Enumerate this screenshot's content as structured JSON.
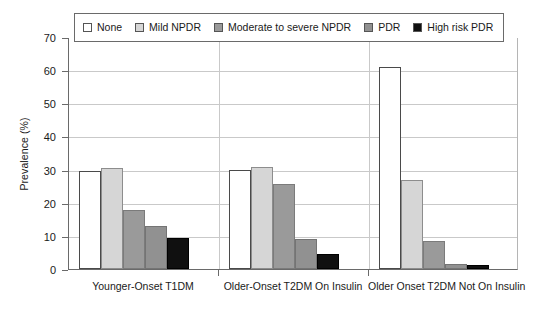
{
  "chart_data": {
    "type": "bar",
    "title": "",
    "subtitle": "",
    "xlabel": "",
    "ylabel": "Prevalence (%)",
    "ylim": [
      0,
      70
    ],
    "yticks": [
      0,
      10,
      20,
      30,
      40,
      50,
      60,
      70
    ],
    "ytick_labels": [
      "0",
      "10",
      "20",
      "30",
      "40",
      "50",
      "60",
      "70"
    ],
    "grid": true,
    "grid_axis": "y",
    "legend_position": "top-inside",
    "categories": [
      "Younger-Onset T1DM",
      "Older-Onset T2DM On Insulin",
      "Older Onset T2DM Not On Insulin"
    ],
    "series": [
      {
        "name": "None",
        "color": "#ffffff",
        "values": [
          29.5,
          30.0,
          61.0
        ]
      },
      {
        "name": "Mild NPDR",
        "color": "#d6d6d6",
        "values": [
          30.5,
          30.8,
          27.0
        ]
      },
      {
        "name": "Moderate to severe NPDR",
        "color": "#9a9a9a",
        "values": [
          17.8,
          25.6,
          8.5
        ]
      },
      {
        "name": "PDR",
        "color": "#919191",
        "values": [
          13.0,
          9.0,
          1.5
        ]
      },
      {
        "name": "High risk PDR",
        "color": "#101010",
        "values": [
          9.5,
          4.5,
          1.2
        ]
      }
    ]
  },
  "legend": {
    "items": [
      {
        "label": "None"
      },
      {
        "label": "Mild NPDR"
      },
      {
        "label": "Moderate to severe NPDR"
      },
      {
        "label": "PDR"
      },
      {
        "label": "High risk PDR"
      }
    ]
  },
  "colors": {
    "axis": "#6a6a6a",
    "gridline": "#c9c9c9",
    "text": "#1a1a1a",
    "background": "#ffffff"
  }
}
